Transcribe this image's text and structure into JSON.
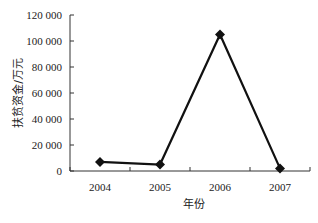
{
  "chart_data": {
    "type": "line",
    "title": "",
    "xlabel": "年份",
    "ylabel": "扶贫资金/万元",
    "categories": [
      "2004",
      "2005",
      "2006",
      "2007"
    ],
    "series": [
      {
        "name": "扶贫资金",
        "values": [
          7000,
          5000,
          105000,
          2000
        ],
        "marker": "diamond",
        "color": "#111111"
      }
    ],
    "yticks": [
      0,
      20000,
      40000,
      60000,
      80000,
      100000,
      120000
    ],
    "ytick_labels": [
      "0",
      "20 000",
      "40 000",
      "60 000",
      "80 000",
      "100 000",
      "120 000"
    ],
    "ylim": [
      0,
      120000
    ],
    "grid": false,
    "legend": "none"
  }
}
